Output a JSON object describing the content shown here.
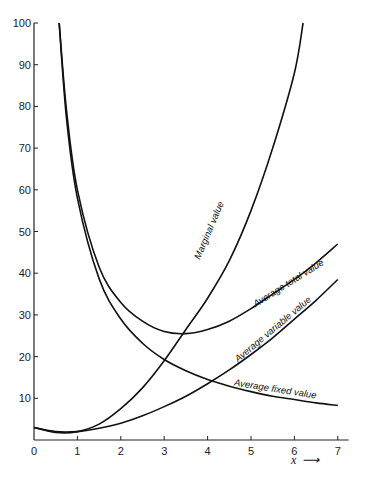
{
  "chart_data": {
    "type": "line",
    "title": "",
    "xlabel": "x",
    "ylabel": "",
    "xlim": [
      0,
      7
    ],
    "ylim": [
      0,
      100
    ],
    "xticks": [
      0,
      1,
      2,
      3,
      4,
      5,
      6,
      7
    ],
    "yticks": [
      10,
      20,
      30,
      40,
      50,
      60,
      70,
      80,
      90,
      100
    ],
    "grid": false,
    "legend": "none (curves labelled inline)",
    "series": [
      {
        "name": "Marginal value",
        "x": [
          0,
          0.5,
          1,
          1.5,
          2,
          2.5,
          3,
          3.5,
          4,
          4.5,
          5,
          5.5,
          6,
          6.2
        ],
        "values": [
          3,
          1.8,
          2,
          3.8,
          7.5,
          12.5,
          19,
          26.5,
          34,
          43,
          55,
          70,
          88,
          100
        ]
      },
      {
        "name": "Average total value",
        "x": [
          0.58,
          0.75,
          1,
          1.5,
          2,
          2.5,
          3,
          3.5,
          4,
          4.5,
          5,
          5.5,
          6,
          6.5,
          7
        ],
        "values": [
          100,
          79,
          60,
          41.5,
          33,
          28.5,
          26,
          25.5,
          26.5,
          28.5,
          31.5,
          35,
          38.5,
          42.5,
          47
        ]
      },
      {
        "name": "Average variable value",
        "x": [
          0,
          0.5,
          1,
          1.5,
          2,
          2.5,
          3,
          3.5,
          4,
          4.5,
          5,
          5.5,
          6,
          6.5,
          7
        ],
        "values": [
          3,
          2,
          2,
          2.8,
          4,
          5.8,
          8,
          10.5,
          13.5,
          16.8,
          20.5,
          24.5,
          29,
          33.5,
          38.5
        ]
      },
      {
        "name": "Average fixed value",
        "x": [
          0.58,
          0.75,
          1,
          1.5,
          2,
          2.5,
          3,
          3.5,
          4,
          4.5,
          5,
          5.5,
          6,
          6.5,
          7
        ],
        "values": [
          100,
          77,
          58,
          38.7,
          29,
          23.2,
          19.3,
          16.6,
          14.5,
          12.9,
          11.6,
          10.5,
          9.7,
          8.9,
          8.3
        ]
      }
    ],
    "annotations": [
      {
        "text": "Marginal value",
        "x": 4.1,
        "y": 50,
        "angle": -67
      },
      {
        "text": "Average total value",
        "x": 5.9,
        "y": 37,
        "angle": -32
      },
      {
        "text": "Average variable value",
        "x": 5.55,
        "y": 26,
        "angle": -40
      },
      {
        "text": "Average fixed value",
        "x": 5.55,
        "y": 11.5,
        "angle": 9
      }
    ]
  },
  "axis": {
    "x_arrow_label": "x",
    "x_arrow_glyph": "⟶"
  }
}
